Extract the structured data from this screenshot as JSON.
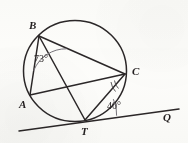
{
  "figure": {
    "background_color": "#fdfdfb",
    "stroke_color": "#231f20",
    "arc_color": "#6b6b6b",
    "labels": {
      "B": "B",
      "C": "C",
      "A": "A",
      "T": "T",
      "Q": "Q"
    },
    "angles": {
      "at_B": {
        "value": "73",
        "degree_symbol": "°",
        "text": "73°",
        "vertex": "B",
        "between": "BA and BC"
      },
      "at_T": {
        "value": "40",
        "degree_symbol": "°",
        "text": "40°",
        "vertex": "T",
        "between": "TC and tangent TQ"
      }
    },
    "points": {
      "B": {
        "x": 39,
        "y": 36
      },
      "C": {
        "x": 125,
        "y": 74
      },
      "A": {
        "x": 30,
        "y": 95
      },
      "T": {
        "x": 85,
        "y": 120
      },
      "Q": {
        "x": 178,
        "y": 110
      }
    },
    "circle": {
      "cx": 75,
      "cy": 71,
      "r": 50
    },
    "segments": [
      {
        "name": "chord-BA",
        "from": "B",
        "to": "A"
      },
      {
        "name": "chord-BT",
        "from": "B",
        "to": "T"
      },
      {
        "name": "chord-BC",
        "from": "B",
        "to": "C"
      },
      {
        "name": "chord-AC",
        "from": "A",
        "to": "C"
      },
      {
        "name": "chord-CT",
        "from": "C",
        "to": "T"
      },
      {
        "name": "tangent-TQ",
        "from": "T",
        "to": "Q"
      }
    ]
  }
}
